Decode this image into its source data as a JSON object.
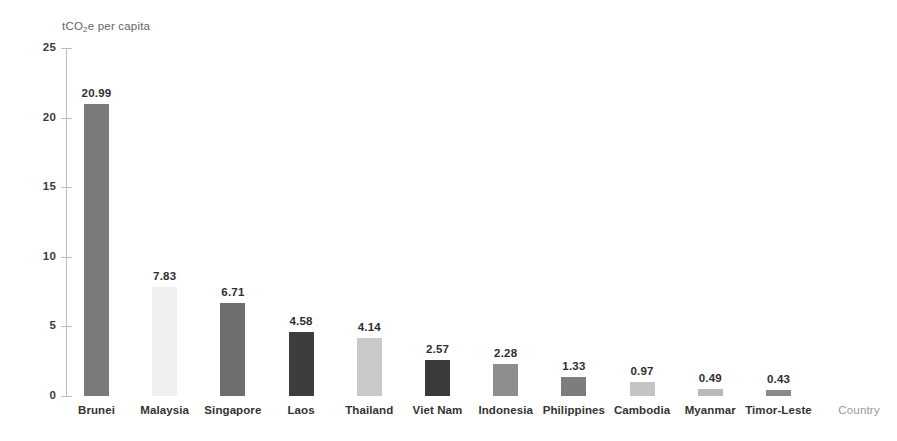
{
  "chart_data": {
    "type": "bar",
    "title": "",
    "subtitle": "",
    "ylabel": "tCO2e per capita",
    "ylabel_parts": {
      "pre": "tCO",
      "sub": "2",
      "post": "e per capita"
    },
    "xlabel": "Country",
    "ylim": [
      0,
      25
    ],
    "yticks": [
      0,
      5,
      10,
      15,
      20,
      25
    ],
    "ytick_labels": [
      "0",
      "5",
      "10",
      "15",
      "20",
      "25"
    ],
    "grid": false,
    "legend": "none",
    "categories": [
      "Brunei",
      "Malaysia",
      "Singapore",
      "Laos",
      "Thailand",
      "Viet Nam",
      "Indonesia",
      "Philippines",
      "Cambodia",
      "Myanmar",
      "Timor-Leste"
    ],
    "values": [
      20.99,
      7.83,
      6.71,
      4.58,
      4.14,
      2.57,
      2.28,
      1.33,
      0.97,
      0.49,
      0.43
    ],
    "value_labels": [
      "20.99",
      "7.83",
      "6.71",
      "4.58",
      "4.14",
      "2.57",
      "2.28",
      "1.33",
      "0.97",
      "0.49",
      "0.43"
    ],
    "bar_colors": [
      "#7a7a7a",
      "#f0f0f0",
      "#6e6e6e",
      "#3d3d3d",
      "#c9c9c9",
      "#3a3a3a",
      "#8d8d8d",
      "#7d7d7d",
      "#c4c4c4",
      "#b9b9b9",
      "#8a8a8a"
    ]
  },
  "axis": {
    "line_color": "#bdbdbd",
    "tick_color": "#bdbdbd",
    "label_color": "#3b3b3b",
    "title_color": "#646464",
    "xtitle_color": "#9a9a9a"
  }
}
